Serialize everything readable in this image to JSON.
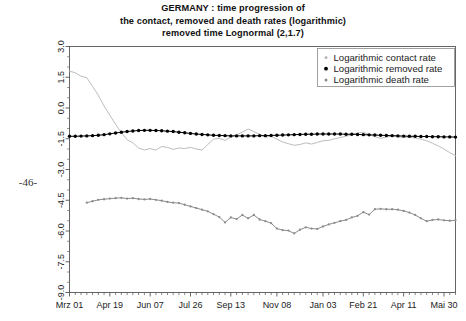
{
  "page": {
    "number_marker": "-46-",
    "background_color": "#ffffff"
  },
  "title": {
    "line1": "GERMANY : time progression of",
    "line2": "the contact, removed and death rates (logarithmic)",
    "line3": "removed time Lognormal (2,1.7)"
  },
  "legend": {
    "position": "top-right",
    "items": [
      {
        "label": "Logarithmic contact rate",
        "color": "#b9b9b9",
        "marker": "dot"
      },
      {
        "label": "Logarithmic removed rate",
        "color": "#000000",
        "marker": "dot"
      },
      {
        "label": "Logarithmic death rate",
        "color": "#8c8c8c",
        "marker": "dot"
      }
    ]
  },
  "chart_data": {
    "type": "line",
    "title": "GERMANY : time progression of the contact, removed and death rates (logarithmic) removed time Lognormal (2,1.7)",
    "xlabel": "",
    "ylabel": "",
    "grid": false,
    "legend_position": "top-right",
    "ylim": [
      -9.0,
      3.0
    ],
    "ytick_labels": [
      "3.0",
      "1.5",
      "0.0",
      "-1.5",
      "-3.0",
      "-4.5",
      "-6.0",
      "-7.5",
      "-9.0"
    ],
    "ytick_values": [
      3.0,
      1.5,
      0.0,
      -1.5,
      -3.0,
      -4.5,
      -6.0,
      -7.5,
      -9.0
    ],
    "xtick_labels": [
      "Mrz 01",
      "Apr 19",
      "Jun 07",
      "Jul 26",
      "Sep 13",
      "Nov 08",
      "Jan 03",
      "Feb 21",
      "Apr 11",
      "Mai 30"
    ],
    "xtick_index": [
      0,
      7,
      14,
      21,
      28,
      36,
      44,
      51,
      58,
      65
    ],
    "x_count": 68,
    "minor_ticks_per_interval": 7,
    "series": [
      {
        "name": "Logarithmic contact rate",
        "color": "#bdbdbd",
        "marker": "none",
        "values": [
          1.8,
          1.72,
          1.55,
          1.48,
          1.05,
          0.62,
          0.1,
          -0.35,
          -0.8,
          -1.2,
          -1.55,
          -1.7,
          -1.95,
          -2.05,
          -1.98,
          -2.05,
          -1.88,
          -1.92,
          -2.02,
          -1.95,
          -1.98,
          -1.92,
          -2.0,
          -2.05,
          -1.78,
          -1.52,
          -1.48,
          -1.58,
          -1.42,
          -1.3,
          -1.18,
          -1.02,
          -1.15,
          -1.28,
          -1.42,
          -1.38,
          -1.52,
          -1.66,
          -1.74,
          -1.82,
          -1.78,
          -1.7,
          -1.76,
          -1.68,
          -1.6,
          -1.58,
          -1.5,
          -1.44,
          -1.38,
          -1.3,
          -1.22,
          -1.18,
          -1.3,
          -1.4,
          -1.48,
          -1.42,
          -1.36,
          -1.4,
          -1.44,
          -1.42,
          -1.46,
          -1.52,
          -1.6,
          -1.72,
          -1.85,
          -2.0,
          -2.18,
          -2.32
        ]
      },
      {
        "name": "Logarithmic removed rate",
        "color": "#000000",
        "marker": "dot",
        "values": [
          -1.38,
          -1.38,
          -1.37,
          -1.36,
          -1.35,
          -1.33,
          -1.3,
          -1.26,
          -1.22,
          -1.18,
          -1.15,
          -1.12,
          -1.1,
          -1.09,
          -1.09,
          -1.1,
          -1.11,
          -1.13,
          -1.15,
          -1.18,
          -1.21,
          -1.24,
          -1.27,
          -1.29,
          -1.31,
          -1.33,
          -1.34,
          -1.35,
          -1.36,
          -1.36,
          -1.36,
          -1.36,
          -1.36,
          -1.35,
          -1.35,
          -1.34,
          -1.33,
          -1.32,
          -1.31,
          -1.3,
          -1.29,
          -1.28,
          -1.28,
          -1.27,
          -1.27,
          -1.27,
          -1.27,
          -1.27,
          -1.28,
          -1.28,
          -1.29,
          -1.3,
          -1.31,
          -1.32,
          -1.33,
          -1.34,
          -1.35,
          -1.36,
          -1.37,
          -1.38,
          -1.38,
          -1.39,
          -1.39,
          -1.4,
          -1.4,
          -1.41,
          -1.41,
          -1.42
        ]
      },
      {
        "name": "Logarithmic death rate",
        "color": "#8c8c8c",
        "marker": "dot",
        "values": [
          null,
          null,
          null,
          -4.62,
          -4.55,
          -4.48,
          -4.45,
          -4.42,
          -4.4,
          -4.38,
          -4.42,
          -4.4,
          -4.44,
          -4.46,
          -4.44,
          -4.48,
          -4.52,
          -4.58,
          -4.62,
          -4.64,
          -4.72,
          -4.8,
          -4.88,
          -4.96,
          -5.04,
          -5.18,
          -5.32,
          -5.58,
          -5.34,
          -5.42,
          -5.22,
          -5.38,
          -5.22,
          -5.44,
          -5.52,
          -5.62,
          -5.88,
          -5.96,
          -5.98,
          -6.12,
          -5.94,
          -5.82,
          -5.88,
          -5.9,
          -5.78,
          -5.68,
          -5.6,
          -5.52,
          -5.46,
          -5.34,
          -5.26,
          -5.08,
          -5.2,
          -4.94,
          -4.92,
          -4.94,
          -4.94,
          -4.96,
          -5.02,
          -5.1,
          -5.22,
          -5.38,
          -5.52,
          -5.46,
          -5.44,
          -5.48,
          -5.5,
          -5.48
        ]
      }
    ]
  }
}
